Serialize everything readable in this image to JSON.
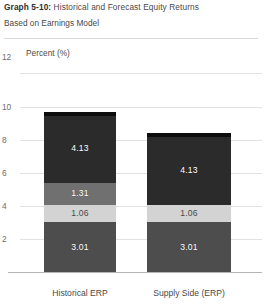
{
  "header": {
    "title_lead": "Graph 5-10:",
    "title_rest": " Historical and Forecast Equity Returns",
    "subtitle": "Based on Earnings Model"
  },
  "chart_data": {
    "type": "bar",
    "subtype": "stacked-bar",
    "title": "Graph 5-10: Historical and Forecast Equity Returns",
    "subtitle": "Based on Earnings Model",
    "xlabel": "",
    "ylabel": "Percent (%)",
    "ylim": [
      0,
      12
    ],
    "yticks": [
      2,
      4,
      6,
      8,
      10,
      12
    ],
    "ytick_labels": [
      "2",
      "4",
      "6",
      "8",
      "10",
      "12"
    ],
    "grid": true,
    "legend": "none",
    "categories": [
      "Historical ERP",
      "Supply Side (ERP)"
    ],
    "series": [
      {
        "name": "Risk-free / base",
        "values": [
          3.01,
          3.01
        ],
        "color": "#4d4d4d",
        "label_color": "#ffffff"
      },
      {
        "name": "Mid band",
        "values": [
          1.06,
          1.06
        ],
        "color": "#d3d3d3",
        "label_color": "#4a4a4a"
      },
      {
        "name": "Upper band",
        "values": [
          1.31,
          0
        ],
        "color": "#707070",
        "label_color": "#ffffff"
      },
      {
        "name": "Equity risk premium",
        "values": [
          4.13,
          4.13
        ],
        "color": "#2b2b2b",
        "label_color": "#ffffff"
      }
    ],
    "totals": [
      9.51,
      8.2
    ],
    "value_labels": {
      "Historical ERP": [
        "3.01",
        "1.06",
        "1.31",
        "4.13"
      ],
      "Supply Side (ERP)": [
        "3.01",
        "1.06",
        "",
        "4.13"
      ]
    },
    "cap_color": "#0d0d0d"
  },
  "axis": {
    "percent_note": "Percent (%)",
    "top_tick": "12"
  },
  "bars": [
    {
      "category": "Historical ERP",
      "x": 44,
      "width": 72,
      "segments": [
        {
          "name": "base",
          "value": 3.01,
          "label": "3.01",
          "color": "#4d4d4d",
          "tone": "dark"
        },
        {
          "name": "mid",
          "value": 1.06,
          "label": "1.06",
          "color": "#d3d3d3",
          "tone": "light"
        },
        {
          "name": "upper",
          "value": 1.31,
          "label": "1.31",
          "color": "#707070",
          "tone": "dark"
        },
        {
          "name": "premium",
          "value": 4.13,
          "label": "4.13",
          "color": "#2b2b2b",
          "tone": "dark"
        }
      ]
    },
    {
      "category": "Supply Side (ERP)",
      "x": 147,
      "width": 84,
      "segments": [
        {
          "name": "base",
          "value": 3.01,
          "label": "3.01",
          "color": "#4d4d4d",
          "tone": "dark"
        },
        {
          "name": "mid",
          "value": 1.06,
          "label": "1.06",
          "color": "#d3d3d3",
          "tone": "light"
        },
        {
          "name": "premium",
          "value": 4.13,
          "label": "4.13",
          "color": "#2b2b2b",
          "tone": "dark"
        }
      ]
    }
  ]
}
